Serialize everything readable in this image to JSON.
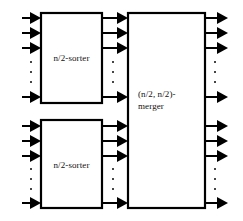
{
  "diagram": {
    "type": "block-diagram",
    "canvas": {
      "width": 243,
      "height": 221,
      "background": "#ffffff"
    },
    "stroke_color": "#000000",
    "text_color": "#111111",
    "blocks": [
      {
        "id": "top-sorter",
        "label": "n/2-sorter",
        "label_lines": [
          "n/2-sorter"
        ],
        "x": 41,
        "y": 13,
        "width": 61,
        "height": 90,
        "label_x": 71.5,
        "label_y": 61,
        "label_anchor": "middle"
      },
      {
        "id": "bottom-sorter",
        "label": "n/2-sorter",
        "label_lines": [
          "n/2-sorter"
        ],
        "x": 41,
        "y": 120,
        "width": 61,
        "height": 88,
        "label_x": 71.5,
        "label_y": 168,
        "label_anchor": "middle"
      },
      {
        "id": "merger",
        "label": "(n/2, n/2)-merger",
        "label_lines": [
          "(n/2, n/2)-",
          "merger"
        ],
        "x": 128,
        "y": 13,
        "width": 77,
        "height": 195,
        "label_x": 138,
        "label_y": 103,
        "label_anchor": "start"
      }
    ],
    "wire_groups": [
      {
        "id": "inputs-top",
        "role": "input",
        "x_start": 22,
        "x_end": 41,
        "arrow_rows": [
          18,
          33,
          48,
          97
        ],
        "dot_rows": [
          62,
          72,
          82
        ],
        "dot_x": 31
      },
      {
        "id": "inputs-bottom",
        "role": "input",
        "x_start": 22,
        "x_end": 41,
        "arrow_rows": [
          126,
          141,
          156,
          203
        ],
        "dot_rows": [
          169,
          179,
          189
        ],
        "dot_x": 31
      },
      {
        "id": "top-sorter-to-merger",
        "role": "internal",
        "x_start": 102,
        "x_end": 128,
        "arrow_rows": [
          18,
          33,
          48,
          97
        ],
        "dot_rows": [
          62,
          72,
          82
        ],
        "dot_x": 113
      },
      {
        "id": "bottom-sorter-to-merger",
        "role": "internal",
        "x_start": 102,
        "x_end": 128,
        "arrow_rows": [
          126,
          141,
          156,
          203
        ],
        "dot_rows": [
          169,
          179,
          189
        ],
        "dot_x": 113
      },
      {
        "id": "outputs-top",
        "role": "output",
        "x_start": 205,
        "x_end": 228,
        "arrow_rows": [
          18,
          33,
          48,
          97
        ],
        "dot_rows": [
          62,
          72,
          82
        ],
        "dot_x": 215
      },
      {
        "id": "outputs-bottom",
        "role": "output",
        "x_start": 205,
        "x_end": 228,
        "arrow_rows": [
          126,
          141,
          156,
          203
        ],
        "dot_rows": [
          169,
          179,
          189
        ],
        "dot_x": 215
      }
    ],
    "ellipsis_glyph": "vertical-ellipsis",
    "arrow_head_length": 11,
    "arrow_head_half_height": 6,
    "dot_size": 1.8
  }
}
